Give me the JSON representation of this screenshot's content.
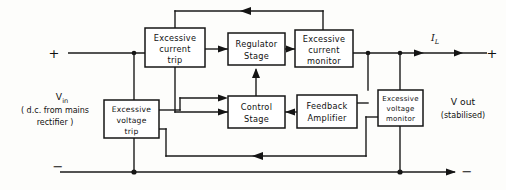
{
  "diagram": {
    "canvas": {
      "width": 506,
      "height": 190
    },
    "ink_color": "#141414",
    "paper_color": "#fdfdfb",
    "blocks": [
      {
        "id": "excessive-current-trip",
        "lines": [
          "Excessive",
          "current",
          "trip"
        ],
        "x": 145,
        "y": 28,
        "w": 60,
        "h": 39
      },
      {
        "id": "regulator-stage",
        "lines": [
          "Regulator",
          "Stage"
        ],
        "x": 228,
        "y": 33,
        "w": 57,
        "h": 32
      },
      {
        "id": "excessive-current-monitor",
        "lines": [
          "Excessive",
          "current",
          "monitor"
        ],
        "x": 295,
        "y": 30,
        "w": 58,
        "h": 37
      },
      {
        "id": "control-stage",
        "lines": [
          "Control",
          "Stage"
        ],
        "x": 228,
        "y": 96,
        "w": 57,
        "h": 32
      },
      {
        "id": "feedback-amplifier",
        "lines": [
          "Feedback",
          "Amplifier"
        ],
        "x": 297,
        "y": 95,
        "w": 60,
        "h": 33
      },
      {
        "id": "excessive-voltage-monitor",
        "lines": [
          "Excessive",
          "voltage",
          "monitor"
        ],
        "x": 378,
        "y": 90,
        "w": 45,
        "h": 36
      },
      {
        "id": "excessive-voltage-trip",
        "lines": [
          "Excessive",
          "voltage",
          "trip"
        ],
        "x": 104,
        "y": 100,
        "w": 55,
        "h": 38
      }
    ],
    "labels": {
      "input_plus": "+",
      "input_minus": "−",
      "output_plus": "+",
      "output_minus": "−",
      "input_name": "V",
      "input_name_sub": "in",
      "input_note_line1": "( d.c. from mains",
      "input_note_line2": "rectifier )",
      "output_name": "V out",
      "output_note": "(stabilised)",
      "load_current": "I",
      "load_current_sub": "L"
    }
  }
}
